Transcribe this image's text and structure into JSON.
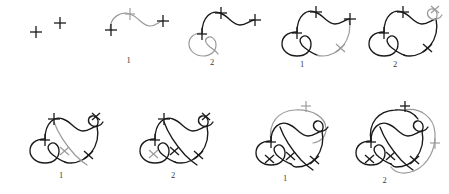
{
  "figure": {
    "background_color": "#ffffff",
    "dark_color": "#1a1a1a",
    "gray_color": "#9a9a9a",
    "rows": 2,
    "columns": 4,
    "width": 449,
    "height": 194
  },
  "panels": [
    {
      "index": 1,
      "row": 1,
      "column": 1,
      "label": "",
      "description": "two isolated plus crossing markers",
      "marker_count": 2,
      "has_gray_stroke": false,
      "has_dark_stroke": false
    },
    {
      "index": 2,
      "row": 1,
      "column": 2,
      "label": "1",
      "description": "gray arc joining left plus to right plus with plus marker on arc",
      "marker_count": 3,
      "has_gray_stroke": true,
      "has_dark_stroke": false
    },
    {
      "index": 3,
      "row": 1,
      "column": 3,
      "label": "2",
      "description": "arc darkened, gray loop added at lower left",
      "marker_count": 3,
      "has_gray_stroke": true,
      "has_dark_stroke": true
    },
    {
      "index": 4,
      "row": 1,
      "column": 4,
      "label": "1",
      "description": "loop darkened, gray strand added descending to the right",
      "marker_count": 3,
      "has_gray_stroke": true,
      "has_dark_stroke": true
    },
    {
      "index": 5,
      "row": 1,
      "column": 5,
      "label": "2",
      "description": "right strand darkened, gray curl added at upper right",
      "marker_count": 4,
      "has_gray_stroke": true,
      "has_dark_stroke": true
    },
    {
      "index": 6,
      "row": 2,
      "column": 1,
      "label": "1",
      "description": "curl darkened, gray diagonal strand added through centre",
      "marker_count": 4,
      "has_gray_stroke": true,
      "has_dark_stroke": true
    },
    {
      "index": 7,
      "row": 2,
      "column": 2,
      "label": "2",
      "description": "diagonal strand darkened, gray crossing mark inside left loop",
      "marker_count": 5,
      "has_gray_stroke": true,
      "has_dark_stroke": true
    },
    {
      "index": 8,
      "row": 2,
      "column": 3,
      "label": "1",
      "description": "gray outer arc added sweeping over the top",
      "marker_count": 5,
      "has_gray_stroke": true,
      "has_dark_stroke": true
    },
    {
      "index": 9,
      "row": 2,
      "column": 4,
      "label": "2",
      "description": "outer arc partly darkened, gray closing loop around the right side",
      "marker_count": 6,
      "has_gray_stroke": true,
      "has_dark_stroke": true
    }
  ],
  "labels": {
    "step_one": "1",
    "step_two": "2",
    "blank": ""
  }
}
